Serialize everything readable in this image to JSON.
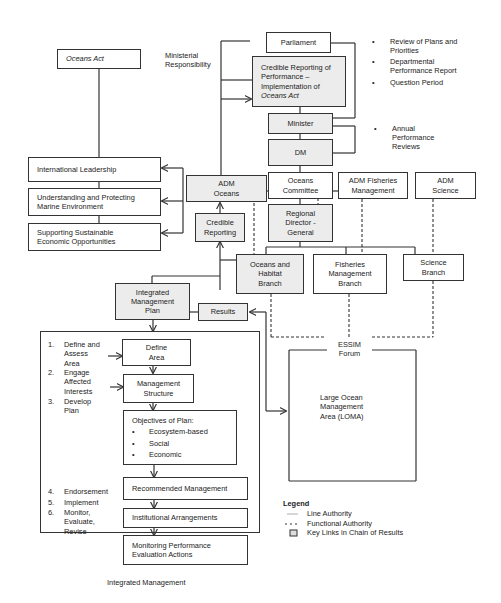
{
  "diagram": {
    "oceans_act": "Oceans Act",
    "ministerial_responsibility": [
      "Ministerial",
      "Responsibility"
    ],
    "parliament": "Parliament",
    "credible_reporting_performance": [
      "Credible Reporting of",
      "Performance –",
      "Implementation of"
    ],
    "credible_reporting_performance_italic": "Oceans Act",
    "minister": "Minister",
    "dm": "DM",
    "parliament_bullets": [
      [
        "Review of Plans and",
        "Priorities"
      ],
      [
        "Departmental",
        "Performance Report"
      ],
      [
        "Question Period"
      ]
    ],
    "dm_bullets": [
      [
        "Annual",
        "Performance",
        "Reviews"
      ]
    ],
    "international_leadership": "International Leadership",
    "understanding_protecting": [
      "Understanding and Protecting",
      "Marine Environment"
    ],
    "supporting_sustainable": [
      "Supporting Sustainable",
      "Economic Opportunities"
    ],
    "adm_oceans": [
      "ADM",
      "Oceans"
    ],
    "oceans_committee": [
      "Oceans",
      "Committee"
    ],
    "adm_fisheries": [
      "ADM Fisheries",
      "Management"
    ],
    "adm_science": [
      "ADM",
      "Science"
    ],
    "credible_reporting": [
      "Credible",
      "Reporting"
    ],
    "regional_director": [
      "Regional",
      "Director -",
      "General"
    ],
    "oceans_habitat_branch": [
      "Oceans and",
      "Habitat",
      "Branch"
    ],
    "fisheries_branch": [
      "Fisheries",
      "Management",
      "Branch"
    ],
    "science_branch": [
      "Science",
      "Branch"
    ],
    "integrated_management_plan": [
      "Integrated",
      "Management",
      "Plan"
    ],
    "results": "Results",
    "essim_forum": [
      "ESSIM",
      "Forum"
    ],
    "loma": [
      "Large Ocean",
      "Management",
      "Area (LOMA)"
    ],
    "steps_top": [
      {
        "num": "1.",
        "label": [
          "Define and",
          "Assess",
          "Area"
        ]
      },
      {
        "num": "2.",
        "label": [
          "Engage",
          "Affected",
          "Interests"
        ]
      },
      {
        "num": "3.",
        "label": [
          "Develop",
          "Plan"
        ]
      }
    ],
    "steps_bottom": [
      {
        "num": "4.",
        "label": [
          "Endorsement"
        ]
      },
      {
        "num": "5.",
        "label": [
          "Implement"
        ]
      },
      {
        "num": "6.",
        "label": [
          "Monitor,",
          "Evaluate,",
          "Revise"
        ]
      }
    ],
    "define_area": [
      "Define",
      "Area"
    ],
    "management_structure": [
      "Management",
      "Structure"
    ],
    "objectives_title": "Objectives of Plan:",
    "objectives": [
      "Ecosystem-based",
      "Social",
      "Economic"
    ],
    "recommended_management": "Recommended Management",
    "institutional_arrangements": "Institutional Arrangements",
    "monitoring_performance": [
      "Monitoring Performance",
      "Evaluation Actions"
    ],
    "integrated_management_caption": "Integrated Management",
    "legend": {
      "title": "Legend",
      "items": [
        {
          "symbol": "solid-line",
          "label": "Line Authority"
        },
        {
          "symbol": "dashed-line",
          "label": "Functional Authority"
        },
        {
          "symbol": "shaded-box",
          "label": "Key Links in Chain of Results"
        }
      ]
    }
  }
}
